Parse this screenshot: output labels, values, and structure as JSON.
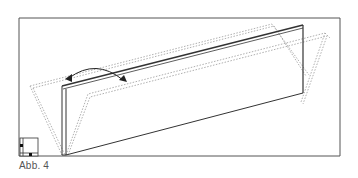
{
  "figure": {
    "caption": "Abb. 4",
    "colors": {
      "frame": "#555555",
      "panel": "#333333",
      "dotted": "#999999",
      "arrow": "#222222"
    },
    "icons": {
      "corner": "view-orientation-icon",
      "arrow": "double-curved-arrow-icon"
    }
  }
}
